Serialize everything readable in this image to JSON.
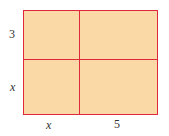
{
  "diagram": {
    "type": "area-model rectangle",
    "fill_color": "#fbd9a6",
    "line_color": "#e0283a",
    "labels": {
      "left_top": "3",
      "left_bottom": "x",
      "bottom_left": "x",
      "bottom_right": "5"
    }
  }
}
